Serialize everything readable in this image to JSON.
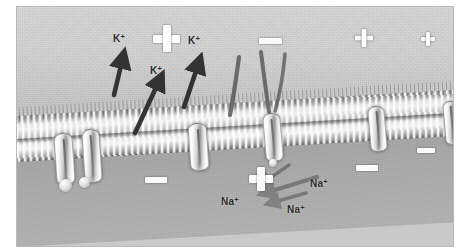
{
  "figure": {
    "kind": "electron-micrograph-style illustration",
    "frame": {
      "page_background": "#ffffff",
      "border_color": "#b9b9b9",
      "left": 16,
      "top": 6,
      "width": 436,
      "height": 239
    }
  },
  "regions": {
    "extracellular": {
      "name": "extracellular-fluid",
      "tone": "#cfcfcf"
    },
    "membrane": {
      "name": "lipid-bilayer",
      "tone": "#e8e8e8"
    },
    "cytoplasm": {
      "name": "intracellular-cytoplasm",
      "tone": "#a4a4a4"
    }
  },
  "ion_labels": [
    {
      "id": "k1",
      "ion": "K",
      "charge": "+",
      "x": 112,
      "y": 36
    },
    {
      "id": "k2",
      "ion": "K",
      "charge": "+",
      "x": 186,
      "y": 38
    },
    {
      "id": "k3",
      "ion": "K",
      "charge": "+",
      "x": 148,
      "y": 68
    },
    {
      "id": "na1",
      "ion": "Na",
      "charge": "+",
      "x": 227,
      "y": 197
    },
    {
      "id": "na2",
      "ion": "Na",
      "charge": "+",
      "x": 316,
      "y": 179
    },
    {
      "id": "na3",
      "ion": "Na",
      "charge": "+",
      "x": 293,
      "y": 205
    }
  ],
  "charge_symbols": [
    {
      "id": "plus-large-out",
      "type": "plus",
      "x": 152,
      "y": 26,
      "size": 27,
      "thickness": 8,
      "side": "extracellular"
    },
    {
      "id": "minus-out",
      "type": "minus",
      "x": 259,
      "y": 36,
      "width": 23,
      "thickness": 6,
      "side": "extracellular"
    },
    {
      "id": "plus-mid-out",
      "type": "plus",
      "x": 355,
      "y": 30,
      "size": 18,
      "thickness": 5,
      "side": "extracellular"
    },
    {
      "id": "plus-small-out",
      "type": "plus",
      "x": 427,
      "y": 32,
      "size": 14,
      "thickness": 4,
      "side": "extracellular"
    },
    {
      "id": "minus-in-left",
      "type": "minus",
      "x": 145,
      "y": 178,
      "width": 22,
      "thickness": 6,
      "side": "cytoplasm"
    },
    {
      "id": "plus-large-in",
      "type": "plus",
      "x": 259,
      "y": 171,
      "size": 24,
      "thickness": 8,
      "side": "cytoplasm"
    },
    {
      "id": "minus-in-mid",
      "type": "minus",
      "x": 355,
      "y": 166,
      "width": 22,
      "thickness": 6,
      "side": "cytoplasm"
    },
    {
      "id": "minus-in-right",
      "type": "minus",
      "x": 424,
      "y": 149,
      "width": 18,
      "thickness": 5,
      "side": "cytoplasm"
    }
  ],
  "arrows": {
    "efflux_label": "K+ efflux (outward)",
    "influx_label": "Na+ influx (inward)",
    "efflux_color": "#3a3a3a",
    "influx_color": "#5c5c5c"
  },
  "channels": [
    {
      "id": "channel-1",
      "x": 43,
      "y": 128,
      "w": 17,
      "h": 48,
      "rot": -4
    },
    {
      "id": "channel-2",
      "x": 73,
      "y": 124,
      "w": 16,
      "h": 50,
      "rot": -4
    },
    {
      "id": "channel-3",
      "x": 178,
      "y": 118,
      "w": 16,
      "h": 44,
      "rot": -4
    },
    {
      "id": "channel-4",
      "x": 253,
      "y": 108,
      "w": 16,
      "h": 45,
      "rot": -5
    },
    {
      "id": "channel-5",
      "x": 358,
      "y": 101,
      "w": 15,
      "h": 42,
      "rot": -5
    },
    {
      "id": "channel-6",
      "x": 433,
      "y": 96,
      "w": 14,
      "h": 40,
      "rot": -5
    }
  ],
  "filaments": {
    "count": 3,
    "color": "#565656",
    "description": "dark curved surface filaments"
  }
}
